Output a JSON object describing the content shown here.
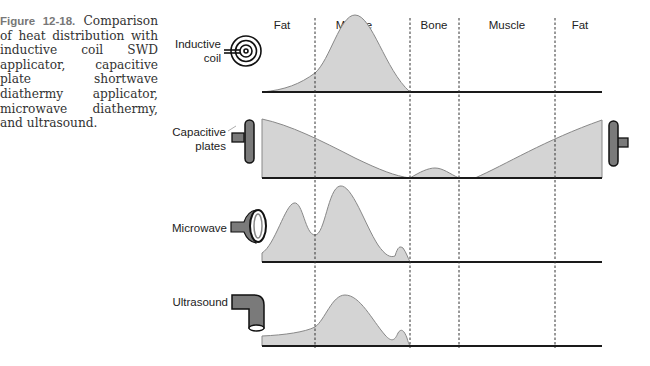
{
  "caption": {
    "figure_label": "Figure 12-18.",
    "text": " Comparison of heat distribution with inductive coil SWD applicator, capacitive plate shortwave diathermy applicator, microwave diathermy, and ultrasound."
  },
  "tissue_layers": [
    {
      "label": "Fat"
    },
    {
      "label": "Muscle"
    },
    {
      "label": "Bone"
    },
    {
      "label": "Muscle"
    },
    {
      "label": "Fat"
    }
  ],
  "rows": [
    {
      "label_line1": "Inductive",
      "label_line2": "coil",
      "icon": "spiral-coil-icon"
    },
    {
      "label_line1": "Capacitive",
      "label_line2": "plates",
      "icon": "capacitive-plate-icon"
    },
    {
      "label_line1": "Microwave",
      "label_line2": "",
      "icon": "microwave-applicator-icon"
    },
    {
      "label_line1": "Ultrasound",
      "label_line2": "",
      "icon": "ultrasound-transducer-icon"
    }
  ],
  "colors": {
    "fill": "#d4d4d4",
    "curve": "#888888",
    "axis": "#1a1a1a",
    "applicator": "#7a7a7a"
  }
}
